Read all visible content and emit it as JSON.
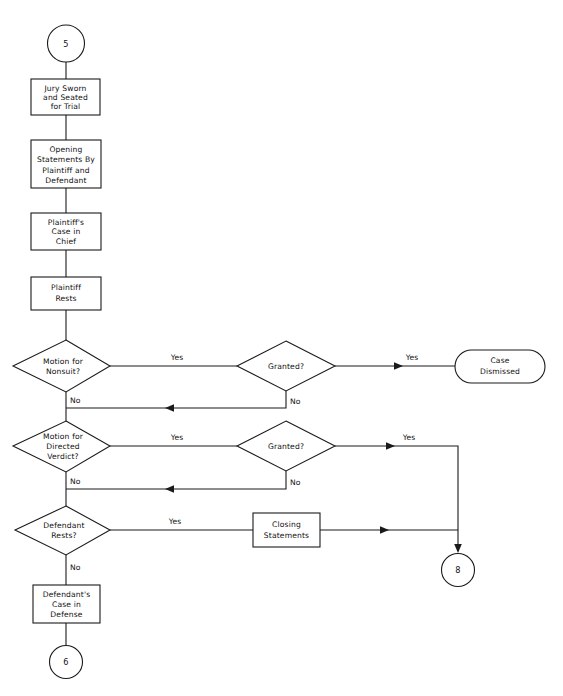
{
  "diagram": {
    "colors": {
      "background": "#ffffff",
      "stroke": "#1a1a1a",
      "text": "#111111",
      "shape_fill": "#ffffff"
    },
    "connectors": [
      {
        "id": "connector-5",
        "label": "5",
        "role": "entry",
        "shape": "circle"
      },
      {
        "id": "connector-8",
        "label": "8",
        "role": "exit",
        "shape": "circle"
      },
      {
        "id": "connector-6",
        "label": "6",
        "role": "exit",
        "shape": "circle"
      }
    ],
    "process_boxes": [
      {
        "id": "jury-sworn",
        "shape": "rectangle",
        "lines": [
          "Jury Sworn",
          "and Seated",
          "for Trial"
        ]
      },
      {
        "id": "opening-statements",
        "shape": "rectangle",
        "lines": [
          "Opening",
          "Statements By",
          "Plaintiff and",
          "Defendant"
        ]
      },
      {
        "id": "plaintiff-case-in-chief",
        "shape": "rectangle",
        "lines": [
          "Plaintiff's",
          "Case in",
          "Chief"
        ]
      },
      {
        "id": "plaintiff-rests",
        "shape": "rectangle",
        "lines": [
          "Plaintiff",
          "Rests"
        ]
      },
      {
        "id": "closing-statements",
        "shape": "rectangle",
        "lines": [
          "Closing",
          "Statements"
        ]
      },
      {
        "id": "defendant-case-in-defense",
        "shape": "rectangle",
        "lines": [
          "Defendant's",
          "Case in",
          "Defense"
        ]
      }
    ],
    "decisions": [
      {
        "id": "motion-nonsuit",
        "shape": "diamond",
        "lines": [
          "Motion for",
          "Nonsuit?"
        ],
        "yes_label": "Yes",
        "no_label": "No"
      },
      {
        "id": "granted-nonsuit",
        "shape": "diamond",
        "lines": [
          "Granted?"
        ],
        "yes_label": "Yes",
        "no_label": "No"
      },
      {
        "id": "motion-directed-verdict",
        "shape": "diamond",
        "lines": [
          "Motion for",
          "Directed",
          "Verdict?"
        ],
        "yes_label": "Yes",
        "no_label": "No"
      },
      {
        "id": "granted-directed-verdict",
        "shape": "diamond",
        "lines": [
          "Granted?"
        ],
        "yes_label": "Yes",
        "no_label": "No"
      },
      {
        "id": "defendant-rests",
        "shape": "diamond",
        "lines": [
          "Defendant",
          "Rests?"
        ],
        "yes_label": "Yes",
        "no_label": "No"
      }
    ],
    "terminators": [
      {
        "id": "case-dismissed",
        "shape": "stadium",
        "lines": [
          "Case",
          "Dismissed"
        ]
      }
    ],
    "edge_labels": {
      "nonsuit_yes": "Yes",
      "nonsuit_no": "No",
      "granted1_yes": "Yes",
      "granted1_no": "No",
      "directed_yes": "Yes",
      "directed_no": "No",
      "granted2_yes": "Yes",
      "granted2_no": "No",
      "defendant_rests_yes": "Yes",
      "defendant_rests_no": "No"
    }
  }
}
